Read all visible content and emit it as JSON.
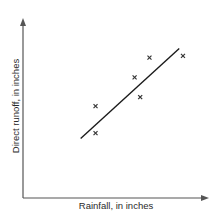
{
  "chart_data": {
    "type": "scatter",
    "title": "",
    "xlabel": "Rainfall, in inches",
    "ylabel": "Direct runoff, in inches",
    "xlim": [
      0,
      10
    ],
    "ylim": [
      0,
      10
    ],
    "grid": false,
    "ticks": "none",
    "legend": null,
    "series": [
      {
        "name": "observations",
        "marker": "x",
        "points": [
          {
            "x": 3.9,
            "y": 5.1
          },
          {
            "x": 3.9,
            "y": 3.6
          },
          {
            "x": 6.0,
            "y": 6.7
          },
          {
            "x": 6.3,
            "y": 5.6
          },
          {
            "x": 6.8,
            "y": 7.8
          },
          {
            "x": 8.6,
            "y": 7.9
          }
        ]
      },
      {
        "name": "fitted line",
        "type": "line",
        "points": [
          {
            "x": 3.1,
            "y": 3.3
          },
          {
            "x": 8.4,
            "y": 8.3
          }
        ]
      }
    ]
  },
  "plot": {
    "origin_px": [
      23,
      198
    ],
    "x_end_px": 209,
    "y_end_px": 18,
    "axis_color": "#555555",
    "line_color": "#1a1a1a",
    "marker_color": "#333333"
  }
}
